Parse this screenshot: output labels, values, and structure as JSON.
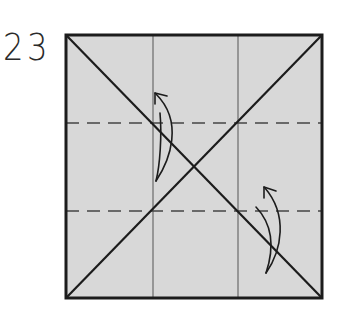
{
  "step": {
    "number": "23"
  },
  "diagram": {
    "type": "origami-fold-step",
    "paper_color": "#d8d8d8",
    "line_color": "#222222",
    "square": {
      "x": 66,
      "y": 35,
      "size_w": 256,
      "size_h": 263
    },
    "crease_lines": {
      "diagonals": 2,
      "vertical_thirds": [
        153,
        238
      ],
      "dashed_valley_folds": [
        123,
        211
      ]
    },
    "arrows": [
      {
        "name": "fold-up-arrow-upper",
        "direction": "up"
      },
      {
        "name": "fold-up-arrow-lower",
        "direction": "up"
      }
    ]
  }
}
